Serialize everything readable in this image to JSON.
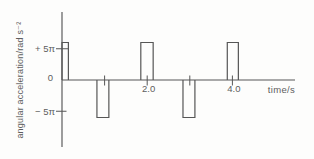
{
  "figure": {
    "colors": {
      "background": "#fdfdfc",
      "line": "#565656",
      "text": "#5e5e5e"
    }
  },
  "chart_data": {
    "type": "line",
    "subtype": "square-pulse-train",
    "title": "",
    "xlabel": "time/s",
    "ylabel": "angular acceleration/rad s⁻²",
    "x_unit": "s",
    "y_unit": "rad s⁻²",
    "xlim_s": [
      0,
      5.5
    ],
    "ylim_pi": [
      -10.5,
      11
    ],
    "grid": false,
    "legend": null,
    "x_ticks": [
      {
        "t": 1.0,
        "label": ""
      },
      {
        "t": 2.0,
        "label": "2.0"
      },
      {
        "t": 3.0,
        "label": ""
      },
      {
        "t": 4.0,
        "label": "4.0"
      }
    ],
    "y_ticks": [
      {
        "value_pi": 5,
        "label": "+ 5π"
      },
      {
        "value_pi": 0,
        "label": "0"
      },
      {
        "value_pi": -5,
        "label": "− 5π"
      }
    ],
    "pulses": [
      {
        "t_start": 0.0,
        "t_end": 0.15,
        "value_pi": 5
      },
      {
        "t_start": 0.82,
        "t_end": 1.1,
        "value_pi": -5
      },
      {
        "t_start": 1.85,
        "t_end": 2.14,
        "value_pi": 5
      },
      {
        "t_start": 2.84,
        "t_end": 3.12,
        "value_pi": -5
      },
      {
        "t_start": 3.88,
        "t_end": 4.14,
        "value_pi": 5
      }
    ],
    "pulse_amplitude_rad_s2": "5π ≈ 15.7"
  }
}
